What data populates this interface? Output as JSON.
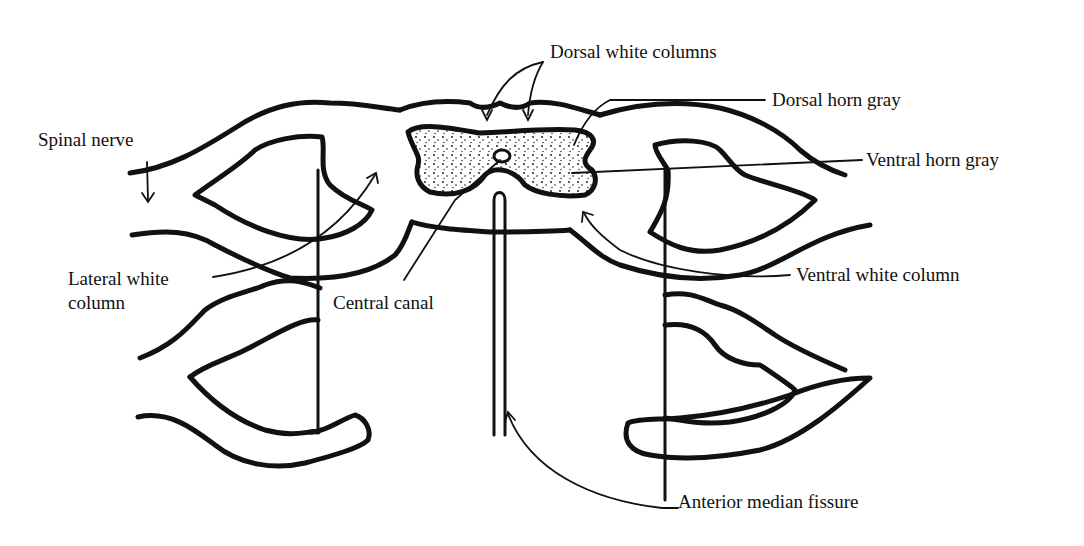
{
  "diagram": {
    "stroke_color": "#111111",
    "background": "#ffffff",
    "labels": {
      "dorsal_white_columns": "Dorsal white columns",
      "dorsal_horn_gray": "Dorsal horn gray",
      "ventral_horn_gray": "Ventral horn gray",
      "spinal_nerve": "Spinal nerve",
      "lateral_white_column_1": "Lateral white",
      "lateral_white_column_2": "column",
      "central_canal": "Central canal",
      "ventral_white_column": "Ventral white column",
      "anterior_median_fissure": "Anterior median fissure"
    }
  }
}
